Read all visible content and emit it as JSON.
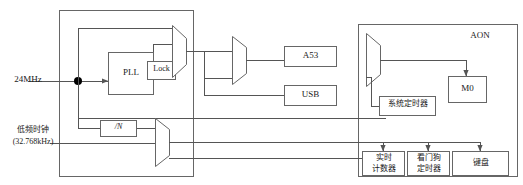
{
  "diagram": {
    "inputs": [
      {
        "name": "high-freq-clock",
        "label": "24MHz"
      },
      {
        "name": "low-freq-clock",
        "label_line1": "低频时钟",
        "label_line2": "(32.768kHz)"
      }
    ],
    "blocks": {
      "pll": {
        "label": "PLL"
      },
      "lock": {
        "label": "Lock"
      },
      "divider": {
        "label": "/N"
      },
      "a53": {
        "label": "A53"
      },
      "usb": {
        "label": "USB"
      },
      "system_timer": {
        "label": "系统定时器"
      },
      "m0": {
        "label": "M0"
      },
      "rtc": {
        "label_line1": "实时",
        "label_line2": "计数器"
      },
      "watchdog": {
        "label_line1": "看门狗",
        "label_line2": "定时器"
      },
      "keypad": {
        "label": "键盘"
      }
    },
    "groups": {
      "clock_gen": {
        "label": ""
      },
      "aon": {
        "label": "AON"
      }
    },
    "muxes": [
      {
        "name": "pll-output-mux",
        "inputs": 2,
        "outputs": 1
      },
      {
        "name": "lowfreq-mux",
        "inputs": 2,
        "outputs": 1
      },
      {
        "name": "core-clock-mux",
        "inputs": 2,
        "outputs": 1
      },
      {
        "name": "aon-clock-mux",
        "inputs": 2,
        "outputs": 1
      }
    ],
    "colors": {
      "line": "#555555",
      "outline": "#666666",
      "text": "#1a1a1a",
      "background": "#ffffff"
    }
  }
}
